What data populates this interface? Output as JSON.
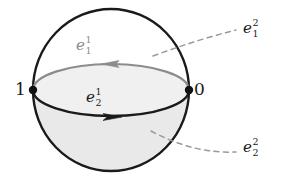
{
  "figure": {
    "type": "diagram",
    "colors": {
      "outline": "#1a1a1a",
      "shading": "#e9e9e9",
      "gray_cell": "#8c8c8c",
      "dashed_leader": "#999999",
      "vertex": "#111111",
      "background": "#ffffff"
    },
    "sphere": {
      "center_x": 111,
      "center_y": 90,
      "radius_x": 78,
      "radius_y": 81,
      "equator_rx": 78,
      "equator_ry": 26,
      "lower_hemisphere_shaded": true
    },
    "vertices": [
      {
        "name": "vertex-one",
        "label": "1",
        "x": 33,
        "y": 90
      },
      {
        "name": "vertex-zero",
        "label": "0",
        "x": 189,
        "y": 90
      }
    ],
    "edges": [
      {
        "name": "edge-e11",
        "base": "e",
        "superscript": "1",
        "subscript": "1",
        "color": "#8c8c8c",
        "direction": "left",
        "arrow_x": 110,
        "arrow_y": 64,
        "description": "upper equator arc, oriented leftward"
      },
      {
        "name": "edge-e21",
        "base": "e",
        "superscript": "1",
        "subscript": "2",
        "color": "#1a1a1a",
        "direction": "right",
        "arrow_x": 112,
        "arrow_y": 117,
        "description": "lower equator arc, oriented rightward"
      }
    ],
    "faces": [
      {
        "name": "face-e12",
        "base": "e",
        "superscript": "2",
        "subscript": "1",
        "color": "#1a1a1a",
        "leader_from_x": 153,
        "leader_from_y": 56,
        "leader_to_x": 236,
        "leader_to_y": 30,
        "description": "upper hemisphere two-cell"
      },
      {
        "name": "face-e22",
        "base": "e",
        "superscript": "2",
        "subscript": "2",
        "color": "#1a1a1a",
        "leader_from_x": 151,
        "leader_from_y": 131,
        "leader_to_x": 236,
        "leader_to_y": 152,
        "description": "lower hemisphere two-cell"
      }
    ]
  }
}
